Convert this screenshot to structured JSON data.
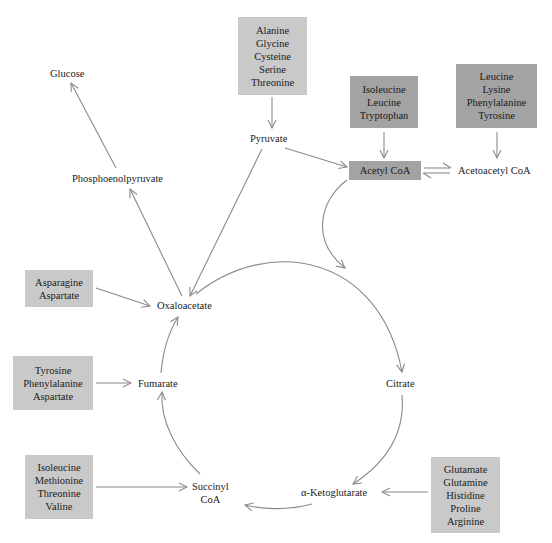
{
  "diagram": {
    "metabolites": {
      "glucose": "Glucose",
      "pep": "Phosphoenolpyruvate",
      "pyruvate": "Pyruvate",
      "acetyl_coa": "Acetyl CoA",
      "acetoacetyl_coa": "Acetoacetyl CoA",
      "oxaloacetate": "Oxaloacetate",
      "citrate": "Citrate",
      "fumarate": "Fumarate",
      "succinyl_coa_1": "Succinyl",
      "succinyl_coa_2": "CoA",
      "alpha_ketoglutarate": "α-Ketoglutarate"
    },
    "amino_acid_groups": {
      "to_pyruvate": [
        "Alanine",
        "Glycine",
        "Cysteine",
        "Serine",
        "Threonine"
      ],
      "to_acetyl_coa": [
        "Isoleucine",
        "Leucine",
        "Tryptophan"
      ],
      "to_acetoacetyl_coa": [
        "Leucine",
        "Lysine",
        "Phenylalanine",
        "Tyrosine"
      ],
      "to_oxaloacetate": [
        "Asparagine",
        "Aspartate"
      ],
      "to_fumarate": [
        "Tyrosine",
        "Phenylalanine",
        "Aspartate"
      ],
      "to_succinyl_coa": [
        "Isoleucine",
        "Methionine",
        "Threonine",
        "Valine"
      ],
      "to_alpha_ketoglutarate": [
        "Glutamate",
        "Glutamine",
        "Histidine",
        "Proline",
        "Arginine"
      ]
    },
    "colors": {
      "light_box": "#c9c9c9",
      "dark_box": "#a3a3a3",
      "arrow": "#8a8a8a"
    }
  }
}
